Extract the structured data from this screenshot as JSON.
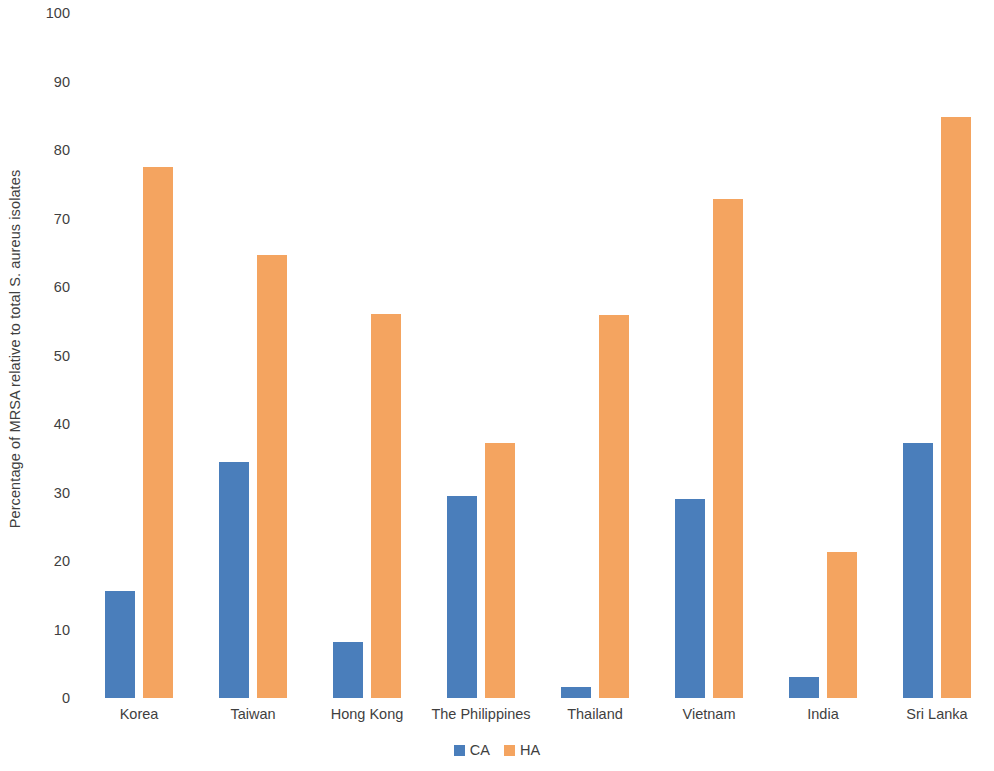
{
  "chart_data": {
    "type": "bar",
    "title": "",
    "subtitle": "",
    "xlabel": "",
    "ylabel": "Percentage of MRSA relative to total S. aureus isolates",
    "ylim": [
      0,
      100
    ],
    "ytick_step": 10,
    "yticks": [
      100,
      90,
      80,
      70,
      60,
      50,
      40,
      30,
      20,
      10,
      0
    ],
    "grid": false,
    "legend_position": "bottom-center",
    "categories": [
      "Korea",
      "Taiwan",
      "Hong Kong",
      "The Philippines",
      "Thailand",
      "Vietnam",
      "India",
      "Sri Lanka"
    ],
    "series": [
      {
        "name": "CA",
        "color": "#4a7ebb",
        "values": [
          15.6,
          34.5,
          8.2,
          29.5,
          1.6,
          29.0,
          3.0,
          37.2
        ]
      },
      {
        "name": "HA",
        "color": "#f4a460",
        "values": [
          77.5,
          64.7,
          56.1,
          37.3,
          55.9,
          72.8,
          21.3,
          84.8
        ]
      }
    ]
  },
  "legend": {
    "items": [
      {
        "label": "CA",
        "color": "#4a7ebb"
      },
      {
        "label": "HA",
        "color": "#f4a460"
      }
    ]
  }
}
